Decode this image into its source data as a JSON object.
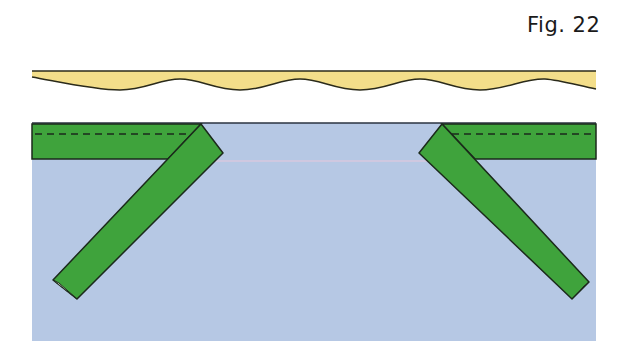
{
  "figure": {
    "label": "Fig. 22"
  },
  "diagram": {
    "elements": [
      {
        "name": "wavy-fabric-edge",
        "color": "#f3de8a"
      },
      {
        "name": "fabric-panel",
        "color": "#b6c8e4"
      },
      {
        "name": "binding-strip-top-left",
        "color": "#3fa33c",
        "has_dashed_stitch_line": true
      },
      {
        "name": "binding-strip-top-right",
        "color": "#3fa33c",
        "has_dashed_stitch_line": true
      },
      {
        "name": "diagonal-strip-left",
        "color": "#3fa33c",
        "direction": "down-left"
      },
      {
        "name": "diagonal-strip-right",
        "color": "#3fa33c",
        "direction": "down-right"
      },
      {
        "name": "guide-line",
        "color": "#e8c8dc"
      }
    ],
    "colors": {
      "yellow": "#f3de8a",
      "blue": "#b6c8e4",
      "green": "#3fa33c",
      "outline": "#1b2a1b",
      "guide": "#e8c8dc",
      "fold": "#f4f1dc"
    }
  }
}
